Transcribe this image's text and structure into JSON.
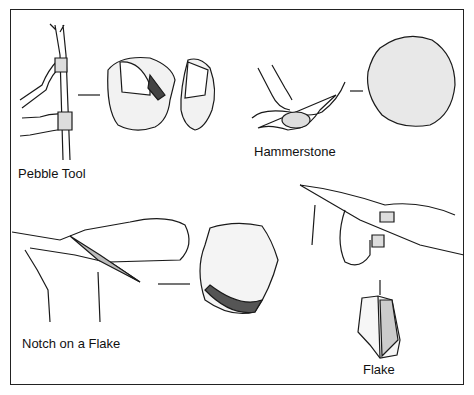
{
  "diagram": {
    "panels": [
      {
        "id": "pebble-tool",
        "label": "Pebble Tool"
      },
      {
        "id": "hammerstone",
        "label": "Hammerstone"
      },
      {
        "id": "notch-on-flake",
        "label": "Notch on a Flake"
      },
      {
        "id": "flake",
        "label": "Flake"
      }
    ]
  },
  "colors": {
    "ink": "#1a1a1a",
    "paper": "#ffffff",
    "stipple": "#555555"
  }
}
